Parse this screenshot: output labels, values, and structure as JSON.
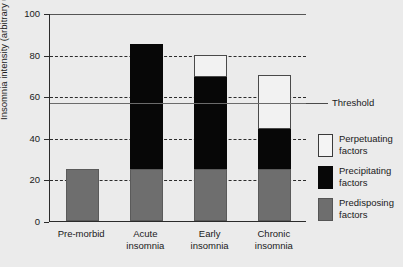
{
  "chart_data": {
    "type": "bar",
    "subtype": "stacked-bar",
    "title": "",
    "xlabel": "",
    "ylabel": "Insomnia intensity (arbitrary units)",
    "ylim": [
      0,
      100
    ],
    "yticks": [
      0,
      20,
      40,
      60,
      80,
      100
    ],
    "ytick_labels": [
      "0",
      "20",
      "40",
      "60",
      "80",
      "100"
    ],
    "grid": "horizontal-dashed",
    "gridline_values": [
      20,
      40,
      60,
      80
    ],
    "categories": [
      "Pre-morbid",
      "Acute insomnia",
      "Early insomnia",
      "Chronic insomnia"
    ],
    "category_lines": [
      [
        "Pre-morbid"
      ],
      [
        "Acute",
        "insomnia"
      ],
      [
        "Early",
        "insomnia"
      ],
      [
        "Chronic",
        "insomnia"
      ]
    ],
    "series": [
      {
        "name": "Predisposing factors",
        "color": "#6e6e6e",
        "values": [
          25,
          25,
          25,
          25
        ]
      },
      {
        "name": "Precipitating factors",
        "color": "#070707",
        "values": [
          0,
          60,
          44,
          19
        ]
      },
      {
        "name": "Perpetuating factors",
        "color": "#ffffff",
        "values": [
          0,
          0,
          11,
          26
        ]
      }
    ],
    "totals": [
      25,
      85,
      80,
      70
    ],
    "annotations": [
      {
        "name": "threshold",
        "label": "Threshold",
        "value": 57,
        "style": "solid-gray-line"
      }
    ],
    "legend": {
      "position": "right",
      "entries": [
        {
          "label_line1": "Perpetuating",
          "label_line2": "factors",
          "swatch": "white"
        },
        {
          "label_line1": "Precipitating",
          "label_line2": "factors",
          "swatch": "black"
        },
        {
          "label_line1": "Predisposing",
          "label_line2": "factors",
          "swatch": "gray"
        }
      ]
    },
    "colors": {
      "background": "#ebebeb",
      "axis": "#2b2b2b",
      "grid": "#2b2b2b",
      "threshold": "#6b6b6b",
      "predisposing": "#6e6e6e",
      "precipitating": "#070707",
      "perpetuating": "#ffffff"
    }
  }
}
